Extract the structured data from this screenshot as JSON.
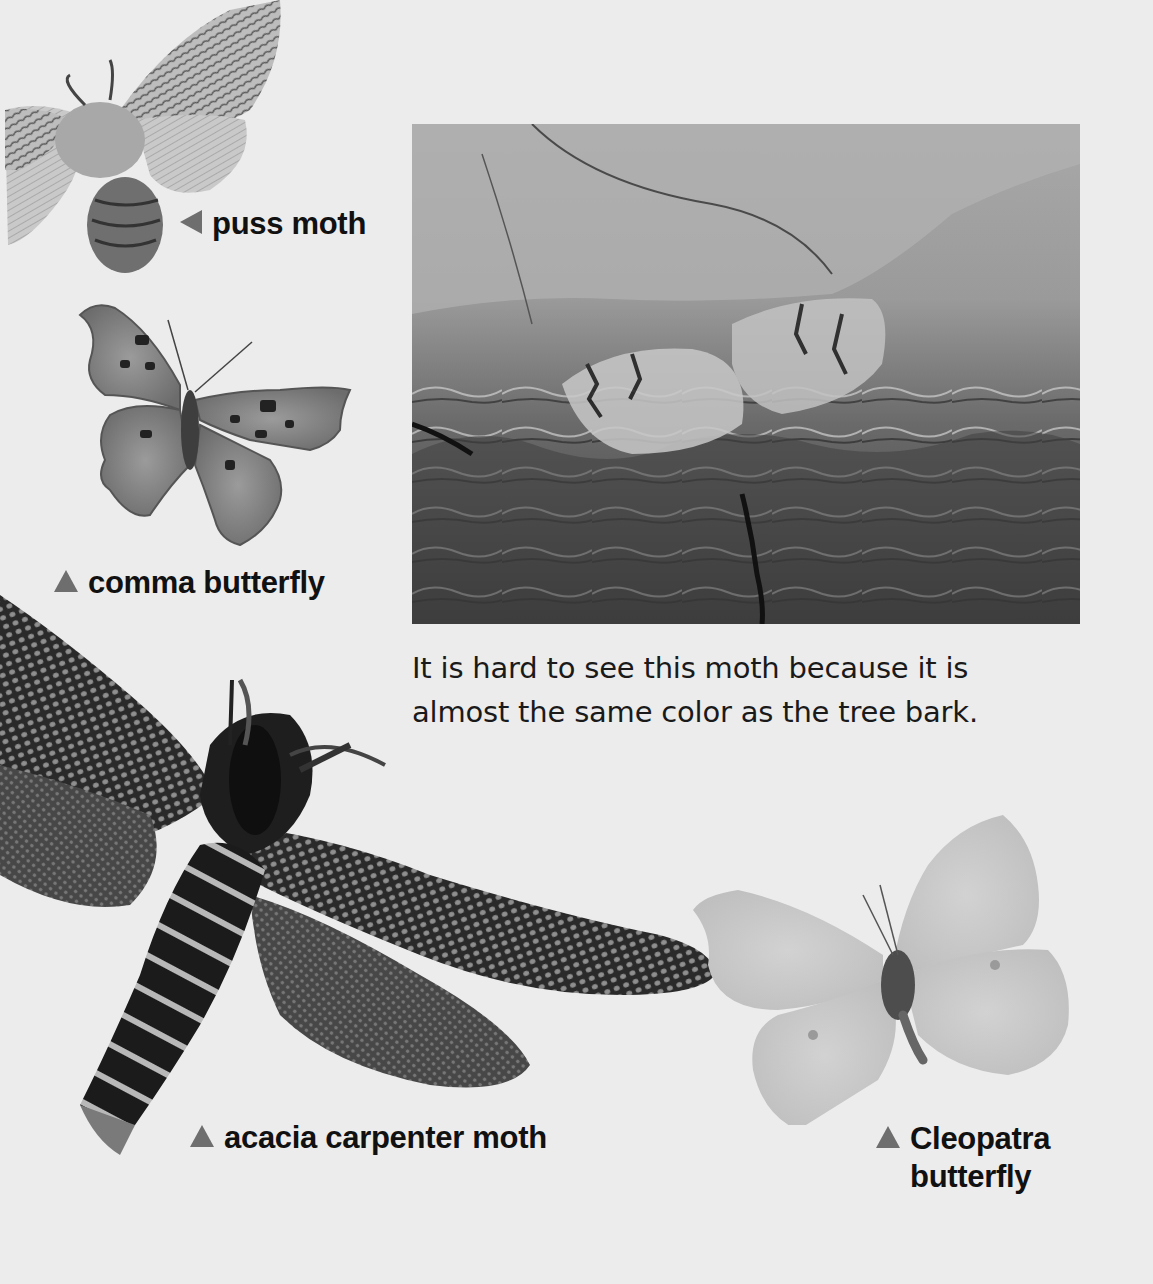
{
  "page": {
    "background_color": "#ececec",
    "caption_marker_color": "#6e6e6e"
  },
  "photos": {
    "bark": {
      "subject": "moth camouflaged on tree bark"
    },
    "puss_moth": {
      "subject": "puss moth"
    },
    "comma_butterfly": {
      "subject": "comma butterfly"
    },
    "acacia_carpenter_moth": {
      "subject": "acacia carpenter moth"
    },
    "cleopatra_butterfly": {
      "subject": "Cleopatra butterfly"
    }
  },
  "captions": {
    "puss_moth": {
      "marker": "left-triangle",
      "label": "puss moth"
    },
    "comma_butterfly": {
      "marker": "up-triangle",
      "label": "comma butterfly"
    },
    "acacia_carpenter_moth": {
      "marker": "up-triangle",
      "label": "acacia carpenter moth"
    },
    "cleopatra_butterfly": {
      "marker": "up-triangle",
      "line1": "Cleopatra",
      "line2": "butterfly"
    }
  },
  "body_text": {
    "line1": "It is hard to see this moth because it is",
    "line2": "almost the same color as the tree bark."
  }
}
